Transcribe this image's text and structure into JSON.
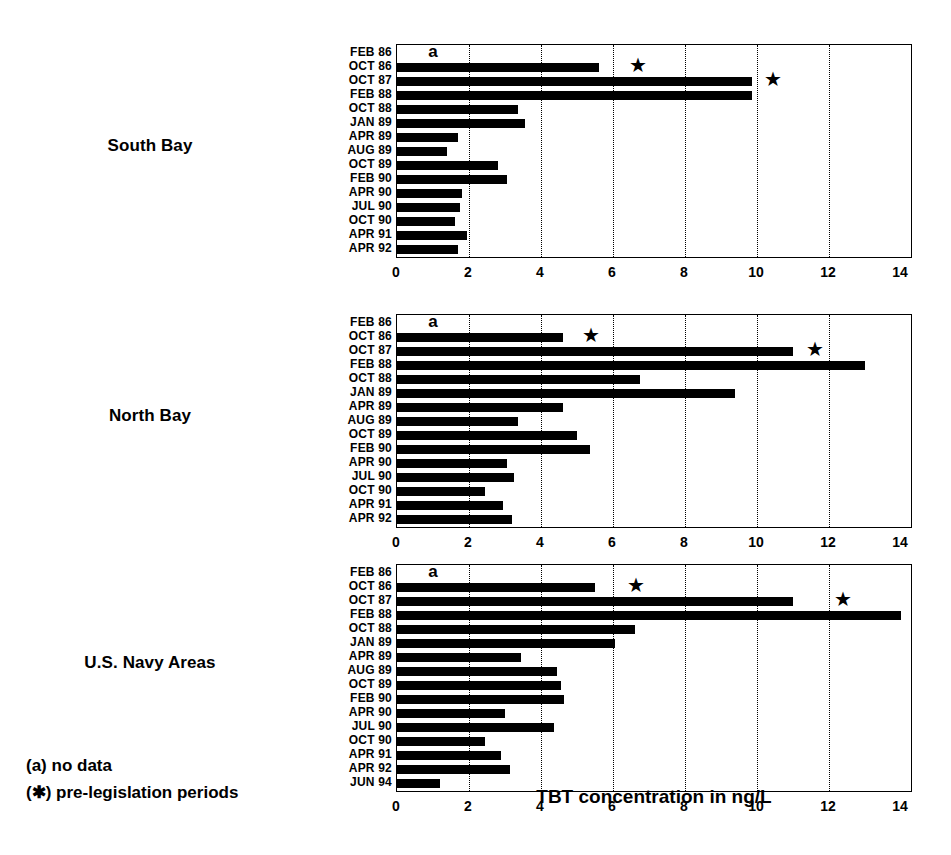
{
  "chart_data": {
    "type": "bar",
    "orientation": "horizontal",
    "title": "",
    "xlabel": "TBT concentration in ng/L",
    "ylabel": "",
    "xlim": [
      0,
      14
    ],
    "xticks": [
      0,
      2,
      4,
      6,
      8,
      10,
      12,
      14
    ],
    "grid": true,
    "grid_axis": "x",
    "legend_position": "bottom-left",
    "bar_color": "#000000",
    "panels": [
      {
        "name": "South Bay",
        "categories": [
          "FEB 86",
          "OCT 86",
          "OCT 87",
          "FEB 88",
          "OCT 88",
          "JAN 89",
          "APR 89",
          "AUG 89",
          "OCT 89",
          "FEB 90",
          "APR 90",
          "JUL 90",
          "OCT 90",
          "APR 91",
          "APR 92"
        ],
        "values": [
          null,
          5.6,
          9.85,
          9.85,
          3.35,
          3.55,
          1.7,
          1.4,
          2.8,
          3.05,
          1.8,
          1.75,
          1.6,
          1.95,
          1.7
        ],
        "no_data_categories": [
          "FEB 86"
        ],
        "no_data_marker": "a",
        "no_data_marker_x": 1.0,
        "stars": [
          {
            "category": "OCT 86",
            "x": 6.7
          },
          {
            "category": "OCT 87",
            "x": 10.45
          }
        ]
      },
      {
        "name": "North Bay",
        "categories": [
          "FEB 86",
          "OCT 86",
          "OCT 87",
          "FEB 88",
          "OCT 88",
          "JAN 89",
          "APR 89",
          "AUG 89",
          "OCT 89",
          "FEB 90",
          "APR 90",
          "JUL 90",
          "OCT 90",
          "APR 91",
          "APR 92"
        ],
        "values": [
          null,
          4.6,
          11.0,
          13.0,
          6.75,
          9.4,
          4.6,
          3.35,
          5.0,
          5.35,
          3.05,
          3.25,
          2.45,
          2.95,
          3.2
        ],
        "no_data_categories": [
          "FEB 86"
        ],
        "no_data_marker": "a",
        "no_data_marker_x": 1.0,
        "stars": [
          {
            "category": "OCT 86",
            "x": 5.4
          },
          {
            "category": "OCT 87",
            "x": 11.6
          }
        ]
      },
      {
        "name": "U.S. Navy Areas",
        "categories": [
          "FEB 86",
          "OCT 86",
          "OCT 87",
          "FEB 88",
          "OCT 88",
          "JAN 89",
          "APR 89",
          "AUG 89",
          "OCT 89",
          "FEB 90",
          "APR 90",
          "JUL 90",
          "OCT 90",
          "APR 91",
          "APR 92",
          "JUN 94"
        ],
        "values": [
          null,
          5.5,
          11.0,
          14.0,
          6.6,
          6.05,
          3.45,
          4.45,
          4.55,
          4.65,
          3.0,
          4.35,
          2.45,
          2.9,
          3.15,
          1.2
        ],
        "no_data_categories": [
          "FEB 86"
        ],
        "no_data_marker": "a",
        "no_data_marker_x": 1.0,
        "stars": [
          {
            "category": "OCT 86",
            "x": 6.65
          },
          {
            "category": "OCT 87",
            "x": 12.4
          }
        ]
      }
    ],
    "annotations": [
      {
        "text": "(a) no data"
      },
      {
        "text": "(✱) pre-legislation periods"
      }
    ]
  },
  "legend": {
    "line_1": "(a) no data",
    "line_2": "(✱) pre-legislation periods"
  },
  "axis_title": "TBT concentration in ng/L"
}
